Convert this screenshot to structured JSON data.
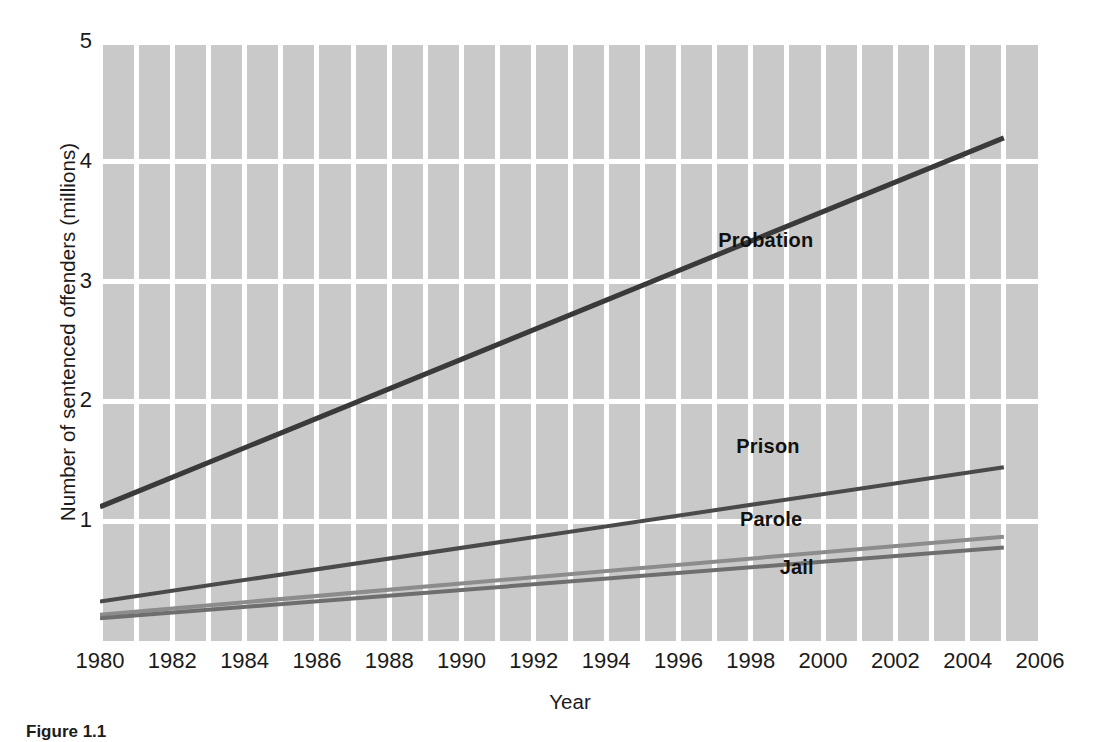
{
  "chart_data": {
    "type": "line",
    "title": "",
    "xlabel": "Year",
    "ylabel": "Number of sentenced offenders (millions)",
    "xlim": [
      1980,
      2006
    ],
    "ylim": [
      0.0,
      5.0
    ],
    "grid": true,
    "grid_color": "#ffffff",
    "plot_background": "#c9c9c9",
    "legend_position": "inline-labels-right",
    "x_ticks": [
      "1980",
      "1982",
      "1984",
      "1986",
      "1988",
      "1990",
      "1992",
      "1994",
      "1996",
      "1998",
      "2000",
      "2002",
      "2004",
      "2006"
    ],
    "x_tick_values": [
      1980,
      1982,
      1984,
      1986,
      1988,
      1990,
      1992,
      1994,
      1996,
      1998,
      2000,
      2002,
      2004,
      2006
    ],
    "y_ticks": [
      "1",
      "2",
      "3",
      "4",
      "5"
    ],
    "y_tick_values": [
      1,
      2,
      3,
      4,
      5
    ],
    "x": [
      1980,
      2005
    ],
    "series": [
      {
        "name": "Probation",
        "color": "#3a3a3a",
        "width": 5,
        "values": [
          1.12,
          4.2
        ],
        "label_x": 1997.1,
        "label_y": 3.35
      },
      {
        "name": "Prison",
        "color": "#4a4a4a",
        "width": 4,
        "values": [
          0.33,
          1.45
        ],
        "label_x": 1997.6,
        "label_y": 1.63
      },
      {
        "name": "Parole",
        "color": "#8c8c8c",
        "width": 4,
        "values": [
          0.22,
          0.87
        ],
        "label_x": 1997.7,
        "label_y": 1.02
      },
      {
        "name": "Jail",
        "color": "#6e6e6e",
        "width": 4,
        "values": [
          0.19,
          0.78
        ],
        "label_x": 1998.8,
        "label_y": 0.62
      }
    ]
  },
  "caption": {
    "text": "Figure 1.1"
  }
}
